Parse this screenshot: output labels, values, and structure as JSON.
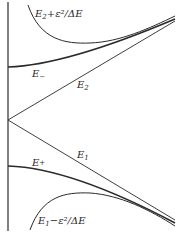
{
  "diagram": {
    "type": "energy-level avoided crossing",
    "colors": {
      "line": "#2a2a2a",
      "background": "#ffffff"
    },
    "labels": {
      "upper_asymptote": {
        "base": "E",
        "sub": "2",
        "rest": "+ε²/ΔE"
      },
      "e_minus": {
        "base": "E",
        "sub": "−"
      },
      "e2": {
        "base": "E",
        "sub": "2"
      },
      "e_plus": {
        "base": "E",
        "sub": "+"
      },
      "e1": {
        "base": "E",
        "sub": "1"
      },
      "lower_asymptote": {
        "base": "E",
        "sub": "1",
        "rest": "−ε²/ΔE"
      }
    },
    "curves": [
      {
        "name": "vertical-axis",
        "kind": "axis"
      },
      {
        "name": "E2",
        "kind": "line",
        "from_vertex": true,
        "direction": "up"
      },
      {
        "name": "E1",
        "kind": "line",
        "from_vertex": true,
        "direction": "down"
      },
      {
        "name": "E-",
        "kind": "curve",
        "approaches": "E2 at large x"
      },
      {
        "name": "E+",
        "kind": "curve",
        "approaches": "E1 at large x"
      },
      {
        "name": "E2+ε²/ΔE",
        "kind": "perturbative curve"
      },
      {
        "name": "E1−ε²/ΔE",
        "kind": "perturbative curve"
      }
    ]
  }
}
